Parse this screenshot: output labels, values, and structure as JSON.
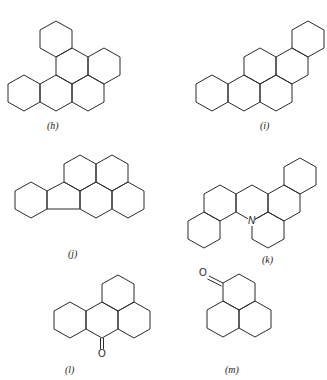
{
  "figure": {
    "structures": [
      {
        "id": "h",
        "label": "(h)",
        "rings": 6,
        "label_pos": [
          47,
          120
        ]
      },
      {
        "id": "i",
        "label": "(i)",
        "rings": 6,
        "label_pos": [
          260,
          120
        ]
      },
      {
        "id": "j",
        "label": "(j)",
        "rings": 6,
        "five_membered_ring": true,
        "label_pos": [
          68,
          248
        ]
      },
      {
        "id": "k",
        "label": "(k)",
        "rings": 6,
        "heteroatom": "N",
        "label_pos": [
          262,
          254
        ]
      },
      {
        "id": "l",
        "label": "(l)",
        "rings": 4,
        "substituent": "O",
        "label_pos": [
          65,
          364
        ]
      },
      {
        "id": "m",
        "label": "(m)",
        "rings": 3,
        "substituent": "O",
        "label_pos": [
          225,
          364
        ]
      }
    ],
    "atoms": {
      "k_nitrogen": "N",
      "l_oxygen": "O",
      "m_oxygen": "O"
    },
    "hex_geometry": {
      "half_width": 16,
      "side": 18
    },
    "hex_centers": {
      "h": [
        [
          56,
          39
        ],
        [
          72,
          66
        ],
        [
          104,
          66
        ],
        [
          24,
          93
        ],
        [
          56,
          93
        ],
        [
          88,
          93
        ]
      ],
      "i": [
        [
          308,
          39
        ],
        [
          260,
          66
        ],
        [
          292,
          66
        ],
        [
          212,
          93
        ],
        [
          244,
          93
        ],
        [
          276,
          93
        ]
      ],
      "j": [
        [
          80,
          173
        ],
        [
          112,
          173
        ],
        [
          96,
          200
        ],
        [
          128,
          200
        ],
        [
          31,
          200
        ]
      ],
      "k": [
        [
          300,
          176
        ],
        [
          220,
          203
        ],
        [
          252,
          203
        ],
        [
          284,
          203
        ],
        [
          204,
          230
        ],
        [
          268,
          230
        ]
      ],
      "l": [
        [
          118,
          293
        ],
        [
          70,
          320
        ],
        [
          102,
          320
        ],
        [
          134,
          320
        ]
      ],
      "m": [
        [
          239,
          292
        ],
        [
          223,
          319
        ],
        [
          255,
          319
        ]
      ]
    }
  }
}
